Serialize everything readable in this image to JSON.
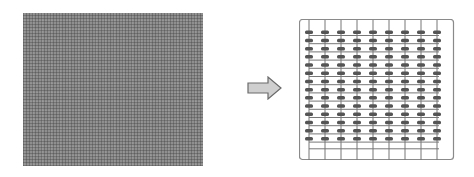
{
  "diagram": {
    "left": {
      "label": "",
      "description": "dense fine grid (grey texture)",
      "fill_color": "#8f8f8f"
    },
    "arrow": {
      "direction": "right",
      "fill_color": "#cfcfcf",
      "stroke_color": "#6a6a6a"
    },
    "right": {
      "description": "grid of wires with components at intersections",
      "columns": 9,
      "rows": 14,
      "line_color": "#777777",
      "component_color": "#555555",
      "border_color": "#8a8a8a"
    }
  }
}
